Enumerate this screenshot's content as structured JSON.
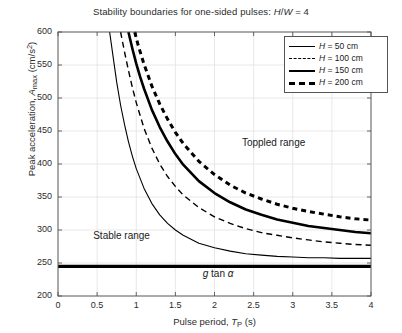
{
  "chart_data": {
    "type": "line",
    "title": "Stability boundaries for one-sided pulses: H/W = 4",
    "title_parts": {
      "prefix": "Stability boundaries for one-sided pulses: ",
      "symbol_h": "H",
      "slash": "/",
      "symbol_w": "W",
      "equals": " = ",
      "value": "4"
    },
    "xlabel": "Pulse period,  T_P (s)",
    "xlabel_parts": {
      "prefix": "Pulse period,  ",
      "symbol": "T",
      "subscript": "P",
      "units": " (s)"
    },
    "ylabel": "Peak acceleration, A_max (cm/s2)",
    "ylabel_parts": {
      "prefix": "Peak acceleration, ",
      "symbol": "A",
      "subscript": "max",
      "units": " (cm/s",
      "exponent": "2",
      "close": ")"
    },
    "xlim": [
      0,
      4
    ],
    "ylim": [
      200,
      600
    ],
    "xticks": [
      "0",
      "0.5",
      "1",
      "1.5",
      "2",
      "2.5",
      "3",
      "3.5",
      "4"
    ],
    "xtick_values": [
      0,
      0.5,
      1,
      1.5,
      2,
      2.5,
      3,
      3.5,
      4
    ],
    "yticks": [
      "200",
      "250",
      "300",
      "350",
      "400",
      "450",
      "500",
      "550",
      "600"
    ],
    "ytick_values": [
      200,
      250,
      300,
      350,
      400,
      450,
      500,
      550,
      600
    ],
    "grid": true,
    "legend_position": "top-right",
    "annotations": [
      {
        "text": "Toppled range",
        "x": 2.35,
        "y": 430
      },
      {
        "text": "Stable range",
        "x": 0.45,
        "y": 290
      },
      {
        "text": "g tan α",
        "x": 1.85,
        "y": 232,
        "italic_parts": {
          "g": "g",
          "tan": " tan ",
          "alpha": "α"
        }
      }
    ],
    "reference_line": {
      "label": "g tan α",
      "value": 245,
      "style": "thick-solid"
    },
    "series": [
      {
        "name": "H = 50 cm",
        "label_parts": {
          "symbol": "H",
          "equals": " = ",
          "value": "50",
          "units": " cm"
        },
        "style": "thin-solid",
        "linewidth": 1.1,
        "dash": "none",
        "x": [
          0.66,
          0.7,
          0.75,
          0.8,
          0.85,
          0.9,
          0.95,
          1.0,
          1.1,
          1.2,
          1.3,
          1.4,
          1.5,
          1.6,
          1.8,
          2.0,
          2.2,
          2.4,
          2.6,
          2.8,
          3.0,
          3.2,
          3.4,
          3.6,
          3.8,
          4.0
        ],
        "y": [
          600,
          566,
          524,
          489,
          460,
          434,
          412,
          393,
          363,
          340,
          323,
          310,
          300,
          292,
          280,
          273,
          268,
          264,
          262,
          260,
          259,
          258,
          258,
          257,
          257,
          257
        ]
      },
      {
        "name": "H = 100 cm",
        "label_parts": {
          "symbol": "H",
          "equals": " = ",
          "value": "100",
          "units": " cm"
        },
        "style": "thin-dash",
        "linewidth": 1.4,
        "dash": "6,4",
        "x": [
          0.8,
          0.85,
          0.9,
          0.95,
          1.0,
          1.1,
          1.2,
          1.3,
          1.4,
          1.5,
          1.6,
          1.8,
          2.0,
          2.2,
          2.4,
          2.6,
          2.8,
          3.0,
          3.2,
          3.4,
          3.6,
          3.8,
          4.0
        ],
        "y": [
          600,
          570,
          542,
          516,
          493,
          454,
          424,
          400,
          381,
          366,
          353,
          334,
          320,
          310,
          302,
          296,
          292,
          288,
          285,
          282,
          280,
          278,
          277
        ]
      },
      {
        "name": "H = 150 cm",
        "label_parts": {
          "symbol": "H",
          "equals": " = ",
          "value": "150",
          "units": " cm"
        },
        "style": "thick-solid",
        "linewidth": 2.6,
        "dash": "none",
        "x": [
          0.9,
          0.95,
          1.0,
          1.05,
          1.1,
          1.2,
          1.3,
          1.4,
          1.5,
          1.6,
          1.8,
          2.0,
          2.2,
          2.4,
          2.6,
          2.8,
          3.0,
          3.2,
          3.4,
          3.6,
          3.8,
          4.0
        ],
        "y": [
          600,
          575,
          552,
          532,
          514,
          482,
          456,
          434,
          415,
          399,
          374,
          356,
          342,
          331,
          323,
          316,
          311,
          306,
          303,
          300,
          297,
          295
        ]
      },
      {
        "name": "H = 200 cm",
        "label_parts": {
          "symbol": "H",
          "equals": " = ",
          "value": "200",
          "units": " cm"
        },
        "style": "thick-dash",
        "linewidth": 3.0,
        "dash": "5,4",
        "x": [
          0.98,
          1.02,
          1.06,
          1.1,
          1.2,
          1.3,
          1.4,
          1.5,
          1.6,
          1.8,
          2.0,
          2.2,
          2.4,
          2.6,
          2.8,
          3.0,
          3.2,
          3.4,
          3.6,
          3.8,
          4.0
        ],
        "y": [
          600,
          582,
          566,
          551,
          518,
          491,
          468,
          448,
          431,
          404,
          384,
          368,
          356,
          347,
          339,
          333,
          328,
          324,
          320,
          317,
          315
        ]
      }
    ]
  }
}
